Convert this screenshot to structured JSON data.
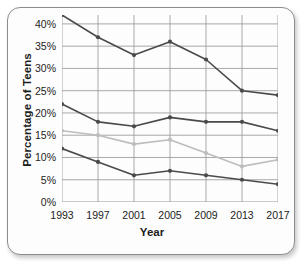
{
  "chart_data": {
    "type": "line",
    "title": "",
    "xlabel": "Year",
    "ylabel": "Percentage of Teens",
    "categories": [
      "1993",
      "1997",
      "2001",
      "2005",
      "2009",
      "2013",
      "2017"
    ],
    "x": [
      1993,
      1997,
      2001,
      2005,
      2009,
      2013,
      2017
    ],
    "xlim": [
      1993,
      2017
    ],
    "ylim": [
      0,
      42
    ],
    "ytick_labels": [
      "0%",
      "5%",
      "10%",
      "15%",
      "20%",
      "25%",
      "30%",
      "35%",
      "40%"
    ],
    "ytick_values": [
      0,
      5,
      10,
      15,
      20,
      25,
      30,
      35,
      40
    ],
    "grid": true,
    "legend": "none",
    "series": [
      {
        "name": "series-1",
        "color": "#4a4a4a",
        "values": [
          42,
          37,
          33,
          36,
          32,
          25,
          24
        ]
      },
      {
        "name": "series-2",
        "color": "#4a4a4a",
        "values": [
          22,
          18,
          17,
          19,
          18,
          18,
          16
        ]
      },
      {
        "name": "series-3",
        "color": "#bdbdbd",
        "values": [
          16,
          15,
          13,
          14,
          11,
          8,
          9.5
        ]
      },
      {
        "name": "series-4",
        "color": "#4a4a4a",
        "values": [
          12,
          9,
          6,
          7,
          6,
          5,
          4
        ]
      }
    ]
  },
  "axes": {
    "y_title": "Percentage of Teens",
    "x_title": "Year"
  },
  "colors": {
    "grid": "#9a9a9a",
    "dark_series": "#4a4a4a",
    "light_series": "#bdbdbd",
    "card_border": "#8d8d8d",
    "card_background": "#fdfdfd",
    "text": "#1c1c1c"
  }
}
